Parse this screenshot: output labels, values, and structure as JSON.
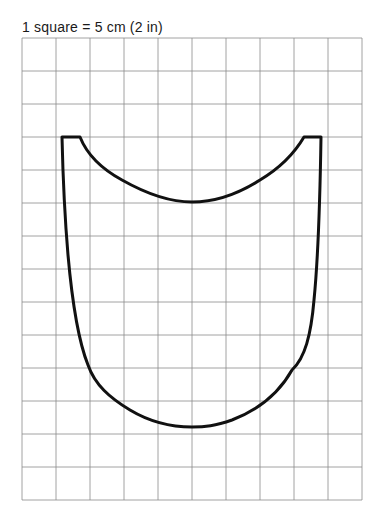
{
  "diagram": {
    "scale_label": "1 square = 5 cm (2 in)",
    "grid": {
      "columns": 10,
      "rows": 14,
      "origin_x": 22,
      "origin_y": 38,
      "cell_width": 34,
      "cell_height": 33,
      "line_color": "#8a8a8a"
    },
    "shape": {
      "name": "bib / apron pattern outline",
      "stroke_color": "#111111",
      "stroke_width": 3
    }
  }
}
